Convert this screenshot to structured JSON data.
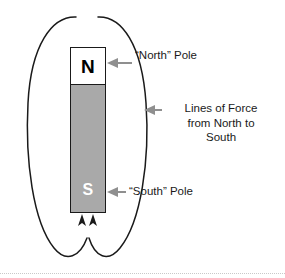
{
  "diagram": {
    "magnet": {
      "north_letter": "N",
      "south_letter": "S",
      "north_fill_color": "#ffffff",
      "south_fill_color": "#a9a9a9",
      "outline_color": "#1a1a1a"
    },
    "labels": {
      "north_pole": "“North” Pole",
      "south_pole": "“South” Pole",
      "lines_of_force": {
        "line1": "Lines of Force",
        "line2": "from North to",
        "line3": "South"
      }
    },
    "field_lines": {
      "description": "Two closed elliptical loops of force encircling the bar magnet, flowing from the North pole around to the South pole",
      "stroke_color": "#1a1a1a",
      "loop_count": 2,
      "arrow_count": 2,
      "arrow_direction": "up into south pole"
    },
    "callout_arrows": {
      "color": "#8f8f8f",
      "count": 3
    }
  }
}
